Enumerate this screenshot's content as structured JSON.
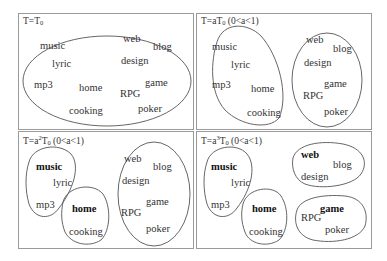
{
  "panels": [
    {
      "title_prefix": "T=T",
      "title_sub": "0",
      "title_sup": "",
      "title_suffix": "",
      "clusters": [
        {
          "words": [
            "music",
            "lyric",
            "mp3",
            "home",
            "cooking",
            "web",
            "blog",
            "design",
            "game",
            "RPG",
            "poker"
          ],
          "heads": []
        }
      ]
    },
    {
      "title_prefix": "T=aT",
      "title_sub": "0",
      "title_sup": "",
      "title_suffix": " (0<a<1)",
      "clusters": [
        {
          "words": [
            "music",
            "lyric",
            "mp3",
            "home",
            "cooking"
          ],
          "heads": []
        },
        {
          "words": [
            "web",
            "blog",
            "design",
            "game",
            "RPG",
            "poker"
          ],
          "heads": []
        }
      ]
    },
    {
      "title_prefix": "T=a",
      "title_sup": "2",
      "title_mid": "T",
      "title_sub": "0",
      "title_suffix": " (0<a<1)",
      "clusters": [
        {
          "words": [
            "music",
            "lyric",
            "mp3"
          ],
          "heads": [
            "music"
          ]
        },
        {
          "words": [
            "home",
            "cooking"
          ],
          "heads": [
            "home"
          ]
        },
        {
          "words": [
            "web",
            "blog",
            "design",
            "game",
            "RPG",
            "poker"
          ],
          "heads": []
        }
      ]
    },
    {
      "title_prefix": "T=a",
      "title_sup": "3",
      "title_mid": "T",
      "title_sub": "0",
      "title_suffix": " (0<a<1)",
      "clusters": [
        {
          "words": [
            "music",
            "lyric",
            "mp3"
          ],
          "heads": [
            "music"
          ]
        },
        {
          "words": [
            "home",
            "cooking"
          ],
          "heads": [
            "home"
          ]
        },
        {
          "words": [
            "web",
            "blog",
            "design"
          ],
          "heads": [
            "web"
          ]
        },
        {
          "words": [
            "game",
            "RPG",
            "poker"
          ],
          "heads": [
            "game"
          ]
        }
      ]
    }
  ],
  "words": {
    "music": "music",
    "lyric": "lyric",
    "mp3": "mp3",
    "home": "home",
    "cooking": "cooking",
    "web": "web",
    "blog": "blog",
    "design": "design",
    "game": "game",
    "RPG": "RPG",
    "poker": "poker"
  },
  "colors": {
    "border": "#9a9a9a",
    "ellipse": "#555555",
    "text": "#333333"
  }
}
